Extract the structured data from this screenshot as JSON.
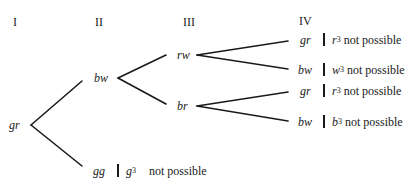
{
  "headers": {
    "col1": "I",
    "col2": "II",
    "col3": "III",
    "col4": "IV"
  },
  "nodes": {
    "root": "gr",
    "level2_upper": "bw",
    "level2_lower": "gg",
    "level3_upper": "rw",
    "level3_lower": "br",
    "level4": [
      "gr",
      "bw",
      "gr",
      "bw"
    ]
  },
  "notes": {
    "gg": {
      "symbol": "g",
      "exponent": "3",
      "text": "not possible"
    },
    "leaf1": {
      "symbol": "r",
      "exponent": "3",
      "text": "not possible"
    },
    "leaf2": {
      "symbol": "w",
      "exponent": "3",
      "text": "not possible"
    },
    "leaf3": {
      "symbol": "r",
      "exponent": "3",
      "text": "not possible"
    },
    "leaf4": {
      "symbol": "b",
      "exponent": "3",
      "text": "not possible"
    }
  },
  "colors": {
    "line": "#1a1a1a",
    "background": "#ffffff"
  }
}
